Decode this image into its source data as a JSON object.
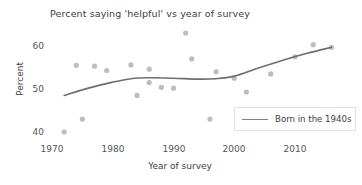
{
  "chart_data": {
    "type": "scatter",
    "title": "Percent saying 'helpful' vs year of survey",
    "xlabel": "Year of survey",
    "ylabel": "Percent",
    "xlim": [
      1968,
      2018
    ],
    "ylim": [
      38.5,
      64
    ],
    "xticks": [
      1970,
      1980,
      1990,
      2000,
      2010
    ],
    "xtick_labels": [
      "1970",
      "1980",
      "1990",
      "2000",
      "2010"
    ],
    "yticks": [
      40,
      50,
      60
    ],
    "ytick_labels": [
      "40",
      "50",
      "60"
    ],
    "grid": false,
    "legend_position": "lower right",
    "point_color": "#bdbdbd",
    "line_color": "#6e6e6e",
    "series": [
      {
        "name": "Born in the 1940s scatter",
        "kind": "scatter",
        "points": [
          {
            "x": 1972,
            "y": 40.0
          },
          {
            "x": 1975,
            "y": 43.0
          },
          {
            "x": 1974,
            "y": 55.5
          },
          {
            "x": 1977,
            "y": 55.3
          },
          {
            "x": 1979,
            "y": 54.3
          },
          {
            "x": 1983,
            "y": 55.6
          },
          {
            "x": 1984,
            "y": 48.5
          },
          {
            "x": 1986,
            "y": 54.6
          },
          {
            "x": 1986,
            "y": 51.5
          },
          {
            "x": 1988,
            "y": 50.4
          },
          {
            "x": 1990,
            "y": 50.2
          },
          {
            "x": 1992,
            "y": 63.0
          },
          {
            "x": 1993,
            "y": 57.0
          },
          {
            "x": 1996,
            "y": 43.0
          },
          {
            "x": 1997,
            "y": 54.0
          },
          {
            "x": 2000,
            "y": 52.5
          },
          {
            "x": 2002,
            "y": 49.3
          },
          {
            "x": 2006,
            "y": 53.5
          },
          {
            "x": 2010,
            "y": 57.5
          },
          {
            "x": 2013,
            "y": 60.3
          },
          {
            "x": 2016,
            "y": 59.7
          }
        ]
      },
      {
        "name": "Born in the 1940s",
        "kind": "line",
        "points": [
          {
            "x": 1972,
            "y": 48.5
          },
          {
            "x": 1976,
            "y": 50.2
          },
          {
            "x": 1980,
            "y": 51.6
          },
          {
            "x": 1983,
            "y": 52.4
          },
          {
            "x": 1986,
            "y": 52.6
          },
          {
            "x": 1990,
            "y": 52.5
          },
          {
            "x": 1994,
            "y": 52.3
          },
          {
            "x": 1997,
            "y": 52.4
          },
          {
            "x": 2000,
            "y": 53.0
          },
          {
            "x": 2004,
            "y": 54.9
          },
          {
            "x": 2008,
            "y": 56.7
          },
          {
            "x": 2012,
            "y": 58.3
          },
          {
            "x": 2016,
            "y": 59.7
          }
        ]
      }
    ],
    "legend": [
      {
        "label": "Born in the 1940s",
        "color": "#808080"
      }
    ]
  }
}
